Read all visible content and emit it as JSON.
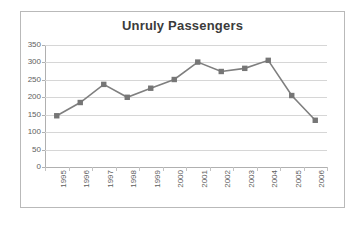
{
  "chart_data": {
    "type": "line",
    "title": "Unruly Passengers",
    "xlabel": "",
    "ylabel": "",
    "categories": [
      "1995",
      "1996",
      "1997",
      "1998",
      "1999",
      "2000",
      "2001",
      "2002",
      "2003",
      "2004",
      "2005",
      "2006"
    ],
    "values": [
      147,
      185,
      237,
      200,
      226,
      251,
      301,
      274,
      283,
      306,
      205,
      134
    ],
    "series": [
      {
        "name": "Unruly Passengers",
        "values": [
          147,
          185,
          237,
          200,
          226,
          251,
          301,
          274,
          283,
          306,
          205,
          134
        ]
      }
    ],
    "ylim": [
      0,
      350
    ],
    "yticks": [
      0,
      50,
      100,
      150,
      200,
      250,
      300,
      350
    ],
    "ytick_labels": [
      "0",
      "50",
      "100",
      "150",
      "200",
      "250",
      "300",
      "350"
    ],
    "grid": true,
    "grid_axis": "y",
    "legend": false,
    "legend_position": "none",
    "marker": "square",
    "colors": {
      "line": "#7f7f7f",
      "marker": "#767676",
      "grid": "#d6d6d6",
      "axis": "#b0b0b0",
      "title_text": "#3b3b3b",
      "tick_text": "#5e5e5e",
      "frame_border": "#b9b9b9",
      "background": "#ffffff"
    }
  }
}
